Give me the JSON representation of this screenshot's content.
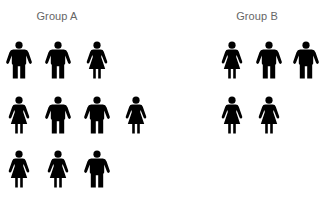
{
  "groups": [
    {
      "title": "Group A",
      "rows": [
        [
          "male",
          "male",
          "female"
        ],
        [
          "female",
          "male",
          "male",
          "female"
        ],
        [
          "female",
          "female",
          "male"
        ]
      ],
      "counts": {
        "male": 5,
        "female": 5,
        "total": 10
      }
    },
    {
      "title": "Group B",
      "rows": [
        [
          "female",
          "male",
          "male"
        ],
        [
          "female",
          "female"
        ]
      ],
      "counts": {
        "male": 2,
        "female": 3,
        "total": 5
      }
    }
  ],
  "icons": {
    "male": "male-person-icon",
    "female": "female-person-icon"
  },
  "colors": {
    "figure": "#000000",
    "title": "#666666",
    "background": "#ffffff"
  }
}
